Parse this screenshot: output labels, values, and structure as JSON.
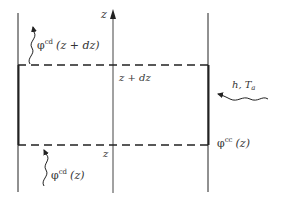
{
  "diagram": {
    "axis_label": "z",
    "top_level_label": "z + dz",
    "bottom_level_label": "z",
    "flux_top": {
      "symbol": "φ",
      "superscript": "cd",
      "argument": "(z + dz)"
    },
    "flux_bottom": {
      "symbol": "φ",
      "superscript": "cd",
      "argument": "(z)"
    },
    "flux_side": {
      "symbol": "φ",
      "superscript": "cc",
      "argument": "(z)"
    },
    "convection": {
      "label_h": "h,",
      "label_T": "T",
      "label_T_sub": "a"
    },
    "colors": {
      "line": "#222222",
      "text": "#333333",
      "background": "#ffffff"
    }
  }
}
